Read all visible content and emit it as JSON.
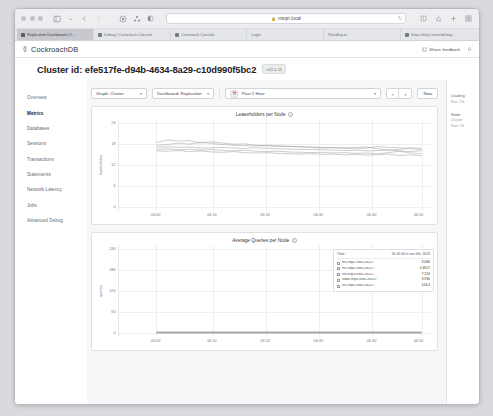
{
  "browser": {
    "traffic_lights": [
      "close",
      "minimize",
      "maximize"
    ],
    "sidebar_toggle_icon": "sidebar-icon",
    "back_icon": "chevron-left-icon",
    "forward_icon": "chevron-right-icon",
    "shield_icon": "shield-icon",
    "extensions_icon": "extensions-icon",
    "reader_icon": "reader-icon",
    "url": "ntsqrt.local",
    "url_lock_icon": "lock-icon",
    "url_reload_icon": "reload-icon",
    "share_icon": "share-icon",
    "download_icon": "download-icon",
    "new_tab_icon": "plus-icon",
    "tabs_overview_icon": "tabs-overview-icon",
    "tabs": [
      {
        "label": "Replication Dashboard | C...",
        "active": true
      },
      {
        "label": "Debug | Cockroach Console",
        "active": false
      },
      {
        "label": "Cockroach Console",
        "active": false
      },
      {
        "label": "Login",
        "active": false
      },
      {
        "label": "Rundhip.io",
        "active": false
      },
      {
        "label": "https://nhjcl.insertdcloiq...",
        "active": false
      }
    ]
  },
  "app_header": {
    "brand": "CockroachDB",
    "brand_icon": "cockroach-icon",
    "share_feedback_label": "Share feedback",
    "share_feedback_icon": "external-link-icon",
    "bell_icon": "bell-icon"
  },
  "cluster": {
    "title": "Cluster id: efe517fe-d94b-4634-8a29-c10d990f5bc2",
    "version_badge": "v22.1.11"
  },
  "sidebar": {
    "items": [
      {
        "label": "Overview",
        "active": false
      },
      {
        "label": "Metrics",
        "active": true
      },
      {
        "label": "Databases",
        "active": false
      },
      {
        "label": "Sessions",
        "active": false
      },
      {
        "label": "Transactions",
        "active": false
      },
      {
        "label": "Statements",
        "active": false
      },
      {
        "label": "Network Latency",
        "active": false
      },
      {
        "label": "Jobs",
        "active": false
      },
      {
        "label": "Advanced Debug",
        "active": false
      }
    ]
  },
  "toolbar": {
    "graph_select": "Graph: Cluster",
    "dashboard_select": "Dashboard: Replication",
    "time_range": "Past 1 Hour",
    "calendar_icon": "calendar-icon",
    "caret_icon": "chevron-down-icon",
    "prev_label": "‹",
    "next_label": "›",
    "now_label": "Now"
  },
  "right_rail": {
    "groups": [
      {
        "title": "Loading",
        "sub": "Run: Ok"
      },
      {
        "title": "Node:",
        "sub": "Cluster",
        "sub2": "Run: Ok"
      }
    ]
  },
  "chart_data": [
    {
      "type": "line",
      "title": "Leaseholders per Node",
      "info_icon": "info-icon",
      "xlabel": "",
      "ylabel": "leaseholders",
      "ylim": [
        0,
        24
      ],
      "yticks": [
        0,
        6,
        12,
        18,
        24
      ],
      "xticks": [
        "06:00",
        "06:10",
        "06:20",
        "06:30",
        "06:40",
        "06:50"
      ],
      "grid": true,
      "series": [
        {
          "name": "node 1",
          "values": [
            18.4,
            19.1,
            18.8,
            18.9,
            18.3,
            18.6,
            18.2,
            17.9,
            18.0,
            17.6,
            17.4,
            17.2,
            17.3,
            17.1,
            17.0,
            16.8,
            16.9,
            16.7,
            16.6,
            16.8,
            17.2,
            17.0,
            16.9,
            16.6,
            16.4
          ]
        },
        {
          "name": "node 2",
          "values": [
            17.6,
            17.8,
            18.2,
            17.9,
            18.4,
            18.1,
            17.8,
            17.6,
            17.5,
            17.4,
            17.6,
            17.5,
            17.3,
            17.2,
            17.1,
            17.0,
            16.9,
            16.9,
            17.0,
            17.1,
            16.6,
            16.2,
            16.4,
            16.9,
            16.7
          ]
        },
        {
          "name": "node 3",
          "values": [
            17.0,
            17.2,
            17.0,
            17.1,
            16.8,
            16.9,
            17.0,
            16.8,
            16.7,
            16.9,
            16.7,
            16.6,
            16.5,
            16.4,
            16.4,
            16.3,
            16.2,
            16.1,
            16.2,
            16.0,
            16.1,
            16.3,
            16.0,
            15.8,
            16.1
          ]
        },
        {
          "name": "node 4",
          "values": [
            16.4,
            16.6,
            16.3,
            16.5,
            16.2,
            16.4,
            16.1,
            16.0,
            16.2,
            15.9,
            15.8,
            15.9,
            15.7,
            15.6,
            15.5,
            15.6,
            15.4,
            15.5,
            15.3,
            15.4,
            15.2,
            15.5,
            15.9,
            15.4,
            15.2
          ]
        },
        {
          "name": "node 5",
          "values": [
            16.0,
            15.9,
            16.1,
            15.8,
            16.0,
            15.7,
            15.6,
            15.8,
            15.5,
            15.4,
            15.5,
            15.3,
            15.2,
            15.1,
            15.2,
            15.0,
            15.1,
            14.9,
            15.0,
            14.8,
            14.9,
            15.1,
            14.7,
            14.9,
            14.6
          ]
        }
      ]
    },
    {
      "type": "line",
      "title": "Average Queries per Node",
      "info_icon": "info-icon",
      "xlabel": "",
      "ylabel": "queries",
      "ylim": [
        0,
        240
      ],
      "yticks": [
        0,
        60,
        120,
        180,
        240
      ],
      "xticks": [
        "06:00",
        "06:10",
        "06:20",
        "06:30",
        "06:40",
        "06:50"
      ],
      "grid": true,
      "series": [
        {
          "name": "node 1",
          "values": [
            2,
            2,
            2,
            2,
            2,
            2,
            2,
            2,
            2,
            2,
            2,
            2,
            2,
            2,
            2,
            2,
            2,
            2,
            2,
            2,
            2,
            2,
            2,
            2,
            2
          ]
        },
        {
          "name": "node 2",
          "values": [
            1,
            1,
            1,
            1,
            1,
            1,
            1,
            1,
            1,
            1,
            1,
            1,
            1,
            1,
            1,
            1,
            1,
            1,
            1,
            1,
            1,
            1,
            1,
            1,
            1
          ]
        },
        {
          "name": "node 3",
          "values": [
            3,
            3,
            3,
            3,
            3,
            3,
            3,
            3,
            3,
            3,
            3,
            3,
            3,
            3,
            3,
            3,
            3,
            3,
            3,
            3,
            3,
            3,
            3,
            3,
            3
          ]
        },
        {
          "name": "node 4",
          "values": [
            1,
            1,
            1,
            1,
            1,
            1,
            1,
            1,
            1,
            1,
            1,
            1,
            1,
            1,
            1,
            1,
            1,
            1,
            1,
            1,
            1,
            1,
            1,
            1,
            1
          ]
        },
        {
          "name": "node 5",
          "values": [
            4,
            4,
            4,
            4,
            4,
            4,
            4,
            4,
            4,
            4,
            4,
            4,
            4,
            4,
            4,
            4,
            4,
            4,
            4,
            4,
            4,
            4,
            4,
            4,
            4
          ]
        }
      ],
      "tooltip": {
        "time_label": "Time:",
        "time_value": "06 41:00 in nov 6th, 2023",
        "rows": [
          {
            "name": "nf1-http1-host-28257:",
            "value": "3.084"
          },
          {
            "name": "nf2-http2-host-28257:",
            "value": "0.4617"
          },
          {
            "name": "nf3-http3-host-28257:",
            "value": "7.224"
          },
          {
            "name": "node-http4-host-28257:",
            "value": "3.930"
          },
          {
            "name": "nf5-http5-host-28257:",
            "value": "103.4"
          }
        ]
      }
    }
  ]
}
